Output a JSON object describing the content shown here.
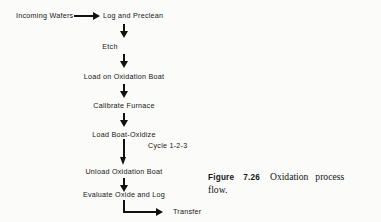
{
  "figure": {
    "type": "process-flow-diagram",
    "caption": {
      "label": "Figure",
      "number": "7.26",
      "text_part1": "Oxidation",
      "text_part2": "process",
      "text_part3": "flow."
    },
    "nodes": [
      {
        "id": "incoming-wafers",
        "label": "Incoming Wafers"
      },
      {
        "id": "log-and-preclean",
        "label": "Log and Preclean"
      },
      {
        "id": "etch",
        "label": "Etch"
      },
      {
        "id": "load-on-oxidation-boat",
        "label": "Load on Oxidation Boat"
      },
      {
        "id": "calibrate-furnace",
        "label": "Calibrate Furnace"
      },
      {
        "id": "load-boat-oxidize",
        "label": "Load Boat-Oxidize"
      },
      {
        "id": "unload-oxidation-boat",
        "label": "Unload Oxidation Boat"
      },
      {
        "id": "evaluate-oxide-and-log",
        "label": "Evaluate Oxide and Log"
      },
      {
        "id": "transfer",
        "label": "Transfer"
      }
    ],
    "annotations": [
      {
        "id": "cycle-label",
        "label": "Cycle  1-2-3"
      }
    ],
    "colors": {
      "ink": "#111111",
      "background": "#fbfbfa",
      "text": "#161616"
    }
  }
}
